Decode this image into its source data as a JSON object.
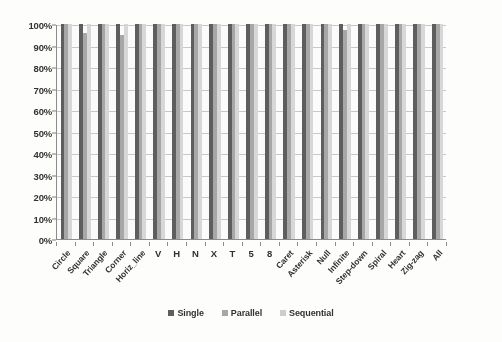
{
  "chart_data": {
    "type": "bar",
    "title": "",
    "subtitle": "",
    "xlabel": "",
    "ylabel": "",
    "ylim": [
      0,
      100
    ],
    "grid": true,
    "legend_position": "bottom",
    "y_tick_labels": [
      "100%",
      "90%",
      "80%",
      "70%",
      "60%",
      "50%",
      "40%",
      "30%",
      "20%",
      "10%",
      "0%"
    ],
    "y_tick_values": [
      100,
      90,
      80,
      70,
      60,
      50,
      40,
      30,
      20,
      10,
      0
    ],
    "categories": [
      "Circle",
      "Square",
      "Triangle",
      "Corner",
      "Horiz_line",
      "V",
      "H",
      "N",
      "X",
      "T",
      "5",
      "8",
      "Caret",
      "Asterisk",
      "Null",
      "Infinite",
      "Step-down",
      "Spiral",
      "Heart",
      "Zig-zag",
      "All"
    ],
    "series": [
      {
        "name": "Single",
        "color": "#595959",
        "values": [
          100,
          100,
          100,
          100,
          100,
          100,
          100,
          100,
          100,
          100,
          100,
          100,
          100,
          100,
          100,
          100,
          100,
          100,
          100,
          100,
          100
        ]
      },
      {
        "name": "Parallel",
        "color": "#a6a6a6",
        "values": [
          100,
          96,
          100,
          95,
          100,
          100,
          100,
          100,
          100,
          100,
          100,
          100,
          100,
          100,
          100,
          97,
          100,
          100,
          100,
          100,
          100
        ]
      },
      {
        "name": "Sequential",
        "color": "#d9d9d9",
        "values": [
          100,
          100,
          100,
          100,
          100,
          100,
          100,
          100,
          100,
          100,
          100,
          100,
          100,
          100,
          100,
          100,
          100,
          100,
          100,
          100,
          100
        ]
      }
    ],
    "legend_entries": [
      "Single",
      "Parallel",
      "Sequential"
    ],
    "upright_label_categories": [
      "V",
      "H",
      "N",
      "X",
      "T",
      "5",
      "8"
    ]
  }
}
